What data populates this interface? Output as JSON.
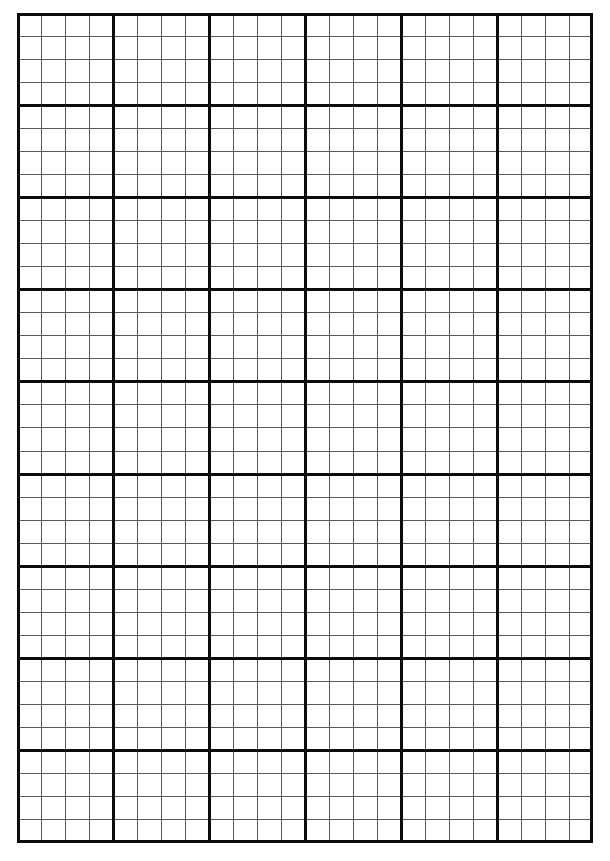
{
  "document": {
    "title": "Graph Paper",
    "kind": "grid-paper-sheet",
    "page_width": 610,
    "page_height": 861,
    "background_color": "#ffffff"
  },
  "chart_data": {
    "type": "table",
    "title": "",
    "subtitle": "",
    "xlabel": "",
    "ylabel": "",
    "grid": true,
    "legend": "none",
    "annotations": [],
    "grid_spec": {
      "origin_x": 17,
      "origin_y": 13,
      "right_edge_x": 593,
      "bottom_edge_y": 843,
      "grid_width": 576,
      "grid_height": 830,
      "minor_cell_width": 24,
      "minor_cell_height": 23.055,
      "minor_columns": 24,
      "minor_rows": 36,
      "major_block_columns": 6,
      "major_block_rows": 9,
      "cells_per_major_block": 4,
      "major_block_width": 96,
      "major_block_height": 92.222,
      "minor_line_width": 1,
      "major_line_width": 3,
      "border_line_width": 3,
      "minor_line_color": "#5a5a5a",
      "major_line_color": "#0c0c0c",
      "border_line_color": "#0c0c0c"
    },
    "major_gridline_x": [
      17,
      113,
      209,
      305,
      401,
      497,
      593
    ],
    "major_gridline_y": [
      13,
      105.2,
      197.4,
      289.7,
      381.9,
      474.1,
      566.3,
      658.6,
      750.8,
      843
    ],
    "categories": [],
    "values": []
  }
}
